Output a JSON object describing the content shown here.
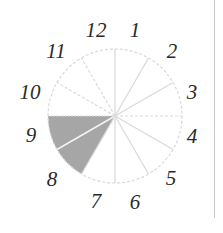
{
  "diagram": {
    "type": "clock-fraction-circle",
    "sectors_total": 12,
    "shaded_sectors": [
      "8",
      "9"
    ],
    "shaded_fraction": "2/12",
    "colors": {
      "shade": "#a6a6a6",
      "spoke": "#d9d9d9",
      "outline": "#d9d9d9",
      "label": "#2a2a2a",
      "divider": "#c8c8c8"
    },
    "labels": [
      {
        "text": "12",
        "x": 96,
        "y": 30
      },
      {
        "text": "1",
        "x": 135,
        "y": 30
      },
      {
        "text": "2",
        "x": 172,
        "y": 51
      },
      {
        "text": "3",
        "x": 192,
        "y": 92
      },
      {
        "text": "4",
        "x": 192,
        "y": 136
      },
      {
        "text": "5",
        "x": 171,
        "y": 178
      },
      {
        "text": "6",
        "x": 135,
        "y": 202
      },
      {
        "text": "7",
        "x": 96,
        "y": 201
      },
      {
        "text": "8",
        "x": 52,
        "y": 179
      },
      {
        "text": "9",
        "x": 31,
        "y": 135
      },
      {
        "text": "10",
        "x": 30,
        "y": 92
      },
      {
        "text": "11",
        "x": 56,
        "y": 51
      }
    ]
  }
}
